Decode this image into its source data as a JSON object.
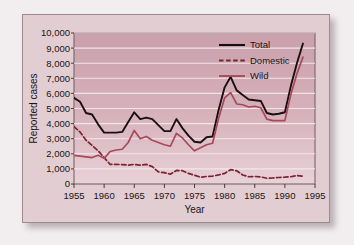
{
  "chart_data": {
    "type": "line",
    "title": "",
    "xlabel": "Year",
    "ylabel": "Reported cases",
    "xlim": [
      1955,
      1995
    ],
    "ylim": [
      0,
      10000
    ],
    "grid": true,
    "legend_position": "top-right",
    "xticks": [
      "1955",
      "1960",
      "1965",
      "1970",
      "1975",
      "1980",
      "1985",
      "1990",
      "1995"
    ],
    "yticks": [
      "0",
      "1,000",
      "2,000",
      "3,000",
      "4,000",
      "5,000",
      "6,000",
      "7,000",
      "8,000",
      "9,000",
      "10,000"
    ],
    "x": [
      1955,
      1956,
      1957,
      1958,
      1959,
      1960,
      1961,
      1962,
      1963,
      1964,
      1965,
      1966,
      1967,
      1968,
      1969,
      1970,
      1971,
      1972,
      1973,
      1974,
      1975,
      1976,
      1977,
      1978,
      1979,
      1980,
      1981,
      1982,
      1983,
      1984,
      1985,
      1986,
      1987,
      1988,
      1989,
      1990,
      1991,
      1992,
      1993
    ],
    "series": [
      {
        "name": "Total",
        "color": "#1a1014",
        "style": "solid",
        "values": [
          5700,
          5450,
          4700,
          4600,
          3950,
          3400,
          3400,
          3400,
          3450,
          4100,
          4750,
          4300,
          4400,
          4300,
          3900,
          3500,
          3500,
          4300,
          3700,
          3200,
          2800,
          2750,
          3100,
          3150,
          4900,
          6400,
          7100,
          6200,
          5900,
          5600,
          5550,
          5500,
          4700,
          4600,
          4650,
          4750,
          6500,
          8000,
          9300
        ]
      },
      {
        "name": "Domestic",
        "color": "#7b2332",
        "style": "dashed",
        "values": [
          3800,
          3450,
          2900,
          2550,
          2200,
          1750,
          1300,
          1300,
          1280,
          1250,
          1300,
          1250,
          1300,
          1150,
          800,
          750,
          650,
          900,
          880,
          700,
          580,
          450,
          500,
          520,
          600,
          700,
          950,
          880,
          600,
          480,
          500,
          470,
          380,
          400,
          430,
          450,
          480,
          560,
          520
        ]
      },
      {
        "name": "Wild",
        "color": "#a8485b",
        "style": "solid",
        "values": [
          1900,
          1850,
          1800,
          1750,
          1900,
          1700,
          2150,
          2250,
          2300,
          2750,
          3550,
          3000,
          3150,
          2900,
          2750,
          2600,
          2500,
          3350,
          3050,
          2600,
          2200,
          2400,
          2600,
          2700,
          4350,
          5700,
          6050,
          5300,
          5250,
          5100,
          5150,
          5050,
          4300,
          4200,
          4200,
          4200,
          5950,
          7300,
          8400
        ]
      }
    ]
  }
}
